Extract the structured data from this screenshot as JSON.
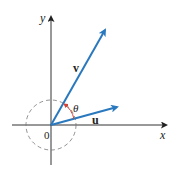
{
  "diagram": {
    "axes": {
      "x_label": "x",
      "y_label": "y",
      "origin_label": "0"
    },
    "vectors": [
      {
        "name": "v",
        "label": "v",
        "color": "#2a78bd"
      },
      {
        "name": "u",
        "label": "u",
        "color": "#2a78bd"
      }
    ],
    "angle": {
      "label": "θ",
      "color": "#d0453a"
    },
    "circle": {
      "style": "dashed",
      "color": "#777777"
    }
  }
}
